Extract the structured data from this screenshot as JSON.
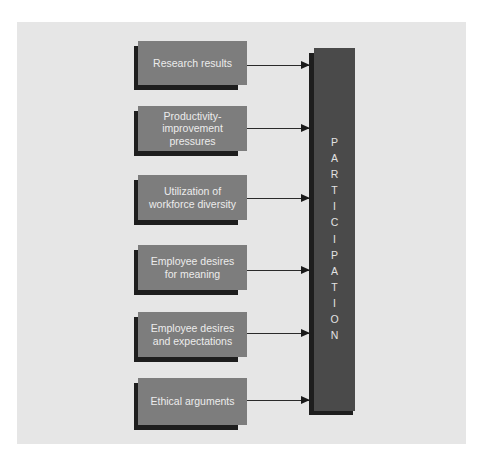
{
  "diagram": {
    "type": "flow-converging",
    "target": {
      "label": "PARTICIPATION",
      "letters": [
        "P",
        "A",
        "R",
        "T",
        "I",
        "C",
        "I",
        "P",
        "A",
        "T",
        "I",
        "O",
        "N"
      ],
      "orientation": "vertical"
    },
    "inputs": [
      {
        "label": "Research results",
        "lines": "Research results"
      },
      {
        "label": "Productivity-improvement pressures",
        "lines": "Productivity-\nimprovement\npressures"
      },
      {
        "label": "Utilization of workforce diversity",
        "lines": "Utilization of\nworkforce diversity"
      },
      {
        "label": "Employee desires for meaning",
        "lines": "Employee desires\nfor meaning"
      },
      {
        "label": "Employee desires and expectations",
        "lines": "Employee desires\nand expectations"
      },
      {
        "label": "Ethical arguments",
        "lines": "Ethical arguments"
      }
    ],
    "edges": [
      {
        "from": "Research results",
        "to": "PARTICIPATION"
      },
      {
        "from": "Productivity-improvement pressures",
        "to": "PARTICIPATION"
      },
      {
        "from": "Utilization of workforce diversity",
        "to": "PARTICIPATION"
      },
      {
        "from": "Employee desires for meaning",
        "to": "PARTICIPATION"
      },
      {
        "from": "Employee desires and expectations",
        "to": "PARTICIPATION"
      },
      {
        "from": "Ethical arguments",
        "to": "PARTICIPATION"
      }
    ]
  },
  "colors": {
    "panel_bg": "#e6e6e6",
    "box_face": "#7d7d7d",
    "box_shadow": "#1e1e1e",
    "box_text": "#ececec",
    "bar_face": "#4a4a4a",
    "bar_text": "#e2e2e2",
    "arrow": "#2a2a2a"
  }
}
